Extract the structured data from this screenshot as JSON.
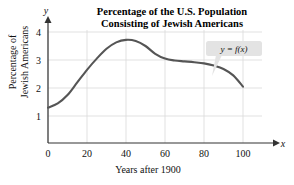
{
  "chart_data": {
    "type": "line",
    "title": "Percentage of the U.S. Population Consisting of Jewish Americans",
    "title_line1": "Percentage of the U.S. Population",
    "title_line2": "Consisting of Jewish Americans",
    "xlabel": "Years after 1900",
    "ylabel": "Percentage of Jewish Americans",
    "ylabel_line1": "Percentage of",
    "ylabel_line2": "Jewish Americans",
    "x_axis_name": "x",
    "y_axis_name": "y",
    "xlim": [
      0,
      110
    ],
    "ylim": [
      0,
      4.3
    ],
    "xticks": [
      0,
      20,
      40,
      60,
      80,
      100
    ],
    "yticks": [
      1,
      2,
      3,
      4
    ],
    "grid": true,
    "legend": "none",
    "annotation": "y = f(x)",
    "curve_color": "#555555",
    "grid_color": "#d9d9d9",
    "axis_color": "#333333",
    "callout_fill": "#e3e3e3",
    "x": [
      0,
      5,
      10,
      15,
      20,
      25,
      30,
      35,
      40,
      45,
      50,
      55,
      60,
      65,
      70,
      75,
      80,
      85,
      90,
      95,
      100
    ],
    "values": [
      1.3,
      1.45,
      1.75,
      2.2,
      2.65,
      3.05,
      3.4,
      3.63,
      3.72,
      3.68,
      3.5,
      3.22,
      3.05,
      2.98,
      2.95,
      2.92,
      2.88,
      2.8,
      2.68,
      2.45,
      2.05
    ]
  },
  "xtick_labels": [
    "0",
    "20",
    "40",
    "60",
    "80",
    "100"
  ],
  "ytick_labels": [
    "1",
    "2",
    "3",
    "4"
  ]
}
